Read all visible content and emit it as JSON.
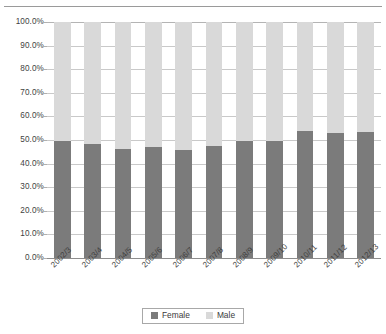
{
  "chart_data": {
    "type": "bar",
    "subtype": "100% stacked column",
    "title": "",
    "subtitle": "",
    "xlabel": "",
    "ylabel": "",
    "ylim": [
      0,
      100
    ],
    "ytick_labels": [
      "100.0%",
      "90.0%",
      "80.0%",
      "70.0%",
      "60.0%",
      "50.0%",
      "40.0%",
      "30.0%",
      "20.0%",
      "10.0%",
      "0.0%"
    ],
    "ytick_values": [
      100,
      90,
      80,
      70,
      60,
      50,
      40,
      30,
      20,
      10,
      0
    ],
    "grid": true,
    "legend_position": "bottom",
    "categories": [
      "2002/3",
      "2003/4",
      "2004/5",
      "2005/6",
      "2006/7",
      "2007/8",
      "2008/9",
      "2009/10",
      "2010/11",
      "2011/12",
      "2012/13"
    ],
    "series": [
      {
        "name": "Female",
        "color": "#7b7b7b",
        "values": [
          49.6,
          48.4,
          46.3,
          47.2,
          45.8,
          47.4,
          49.5,
          49.4,
          53.8,
          52.9,
          53.5
        ]
      },
      {
        "name": "Male",
        "color": "#d9d9d9",
        "values": [
          50.4,
          51.6,
          53.7,
          52.8,
          54.2,
          52.6,
          50.5,
          50.6,
          46.2,
          47.1,
          46.5
        ]
      }
    ]
  },
  "colors": {
    "female": "#7b7b7b",
    "male": "#d9d9d9",
    "gridline": "#c9c9c9",
    "axis": "#8d8d8d",
    "text": "#3f3f3f"
  },
  "legend": {
    "items": [
      {
        "label": "Female",
        "color": "#7b7b7b"
      },
      {
        "label": "Male",
        "color": "#d9d9d9"
      }
    ]
  }
}
